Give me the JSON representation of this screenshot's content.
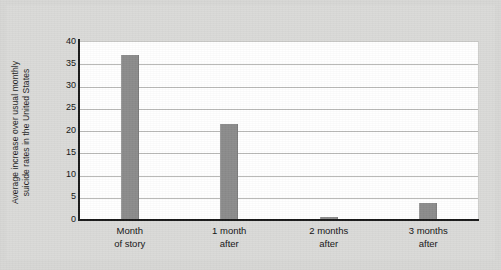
{
  "chart_data": {
    "type": "bar",
    "title": "",
    "xlabel": "",
    "ylabel": "Average increase over usual monthly\nsuicide rates in the United States",
    "categories": [
      "Month\nof story",
      "1 month\nafter",
      "2 months\nafter",
      "3 months\nafter"
    ],
    "values": [
      37,
      21.5,
      0.6,
      3.8
    ],
    "ylim": [
      0,
      40
    ],
    "yticks": [
      40,
      35,
      30,
      25,
      20,
      15,
      10,
      5,
      0
    ],
    "ytick_labels": [
      "40",
      "35",
      "30",
      "25",
      "20",
      "15",
      "10",
      "5",
      "0"
    ],
    "grid": true,
    "legend": false,
    "bar_color": "#8c8c8c",
    "plot_background": "#ffffff",
    "page_background": "#d7d7d5",
    "axis_color": "#1a1a1a",
    "gridline_color": "#b9b9b7"
  }
}
